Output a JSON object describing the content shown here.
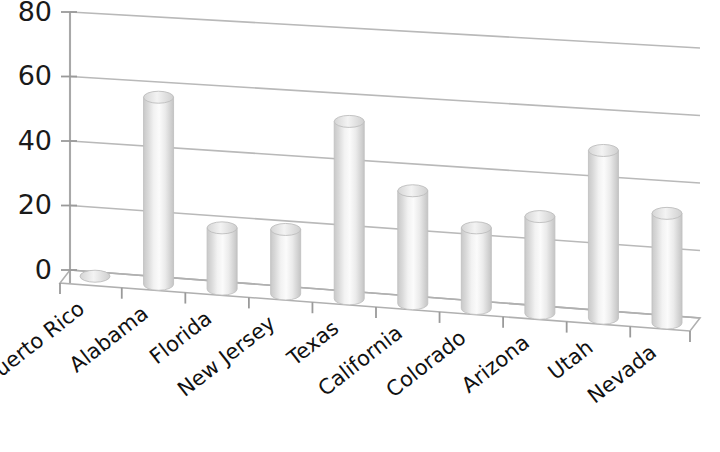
{
  "chart_data": {
    "type": "bar",
    "title": "",
    "subtitle": "",
    "xlabel": "",
    "ylabel": "",
    "categories": [
      "Puerto Rico",
      "Alabama",
      "Florida",
      "New Jersey",
      "Texas",
      "California",
      "Colorado",
      "Arizona",
      "Utah",
      "Nevada"
    ],
    "values": [
      1,
      58,
      19,
      20,
      55,
      35,
      25,
      30,
      52,
      34
    ],
    "ytick_labels": [
      "0",
      "20",
      "40",
      "60",
      "80"
    ],
    "ytick_values": [
      0,
      20,
      40,
      60,
      80
    ],
    "ylim": [
      0,
      80
    ],
    "grid": true,
    "legend": false,
    "legend_position": "none",
    "style": "3d-cylinder",
    "bar_color": "#dcdcdc",
    "bar_highlight_color": "#f5f5f5",
    "grid_color": "#b9b9b9",
    "text_color": "#1a1a1a",
    "background_color": "#ffffff"
  }
}
